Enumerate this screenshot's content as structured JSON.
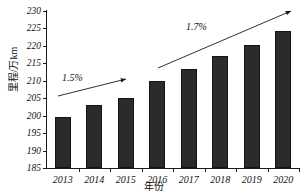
{
  "chart_data": {
    "type": "bar",
    "title": "",
    "subtitle": "",
    "xlabel": "年份",
    "ylabel": "里程/万km",
    "categories": [
      "2013",
      "2014",
      "2015",
      "2016",
      "2017",
      "2018",
      "2019",
      "2020"
    ],
    "values": [
      199.6,
      203.0,
      205.2,
      209.9,
      213.5,
      217.0,
      220.2,
      224.2
    ],
    "series": [
      {
        "name": "里程",
        "values": [
          199.6,
          203.0,
          205.2,
          209.9,
          213.5,
          217.0,
          220.2,
          224.2
        ]
      }
    ],
    "ylim": [
      185,
      230
    ],
    "ytick_labels": [
      "185",
      "190",
      "195",
      "200",
      "205",
      "210",
      "215",
      "220",
      "225",
      "230"
    ],
    "ytick_values": [
      185,
      190,
      195,
      200,
      205,
      210,
      215,
      220,
      225,
      230
    ],
    "ytick_step": 5,
    "grid": false,
    "legend": "none",
    "bar_color": "#2b2b2b",
    "axis_color": "#1a1a1a",
    "background": "#ffffff",
    "annotations": [
      {
        "label": "1.5%",
        "kind": "growth-rate-arrow",
        "span": [
          "2013",
          "2016"
        ],
        "label_x": 62,
        "label_y": 72,
        "arrow_x1": 58,
        "arrow_y1": 96,
        "arrow_x2": 126,
        "arrow_y2": 79
      },
      {
        "label": "1.7%",
        "kind": "growth-rate-arrow",
        "span": [
          "2016",
          "2020"
        ],
        "label_x": 186,
        "label_y": 21,
        "arrow_x1": 158,
        "arrow_y1": 68,
        "arrow_x2": 291,
        "arrow_y2": 11
      }
    ]
  }
}
